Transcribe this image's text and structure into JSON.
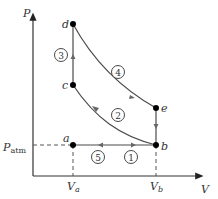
{
  "diagram": {
    "type": "PV-diagram",
    "axes": {
      "y_label": "P",
      "x_label": "V",
      "y_tick": {
        "main": "P",
        "sub": "atm"
      },
      "x_ticks": [
        {
          "main": "V",
          "sub": "a"
        },
        {
          "main": "V",
          "sub": "b"
        }
      ]
    },
    "points": [
      {
        "id": "a",
        "label": "a"
      },
      {
        "id": "b",
        "label": "b"
      },
      {
        "id": "c",
        "label": "c"
      },
      {
        "id": "d",
        "label": "d"
      },
      {
        "id": "e",
        "label": "e"
      }
    ],
    "processes": [
      {
        "number": "1",
        "from": "a",
        "to": "b",
        "shape": "horizontal line"
      },
      {
        "number": "2",
        "from": "b",
        "to": "c",
        "shape": "curve"
      },
      {
        "number": "3",
        "from": "c",
        "to": "d",
        "shape": "vertical line"
      },
      {
        "number": "4",
        "from": "d",
        "to": "e",
        "shape": "curve"
      },
      {
        "number": "5",
        "from": "b",
        "to": "a",
        "shape": "horizontal line"
      }
    ],
    "colors": {
      "line": "#4a4a4a",
      "axis": "#333333",
      "point": "#000000",
      "dashed": "#555555"
    }
  }
}
